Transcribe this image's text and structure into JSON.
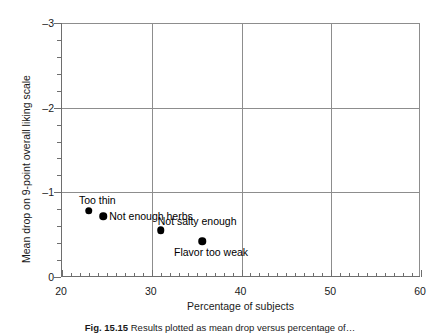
{
  "chart_data": {
    "type": "scatter",
    "title": "",
    "xlabel": "Percentage of subjects",
    "ylabel": "Mean drop on 9-point overall liking scale",
    "xlim": [
      20,
      60
    ],
    "ylim": [
      -3,
      0
    ],
    "y_inverted": true,
    "grid": true,
    "legend": "none",
    "x_ticks_major": [
      20,
      30,
      40,
      50,
      60
    ],
    "x_tick_labels": [
      "20",
      "30",
      "40",
      "50",
      "60"
    ],
    "x_minor_step": 1,
    "y_ticks_major": [
      -3,
      -2,
      -1,
      0
    ],
    "y_tick_labels": [
      "–3",
      "–2",
      "–1",
      "0"
    ],
    "y_minor_step": 0.2,
    "gridlines_x": [
      30,
      40,
      50
    ],
    "gridlines_y": [
      -2,
      -1
    ],
    "points": [
      {
        "label": "Too thin",
        "x": 23.0,
        "y": -0.78,
        "label_pos": "above-left"
      },
      {
        "label": "Not enough herbs",
        "x": 24.6,
        "y": -0.72,
        "label_pos": "right"
      },
      {
        "label": "Not salty enough",
        "x": 31.0,
        "y": -0.55,
        "label_pos": "above-right"
      },
      {
        "label": "Flavor too weak",
        "x": 35.6,
        "y": -0.42,
        "label_pos": "below-right"
      }
    ]
  },
  "caption": {
    "number": "Fig. 15.15",
    "text": "Results plotted as mean drop versus percentage of…"
  },
  "colors": {
    "point": "#000000",
    "grid": "#8d8d8d",
    "axis": "#6e6e6e",
    "text": "#1a1a1a",
    "background": "#ffffff"
  }
}
